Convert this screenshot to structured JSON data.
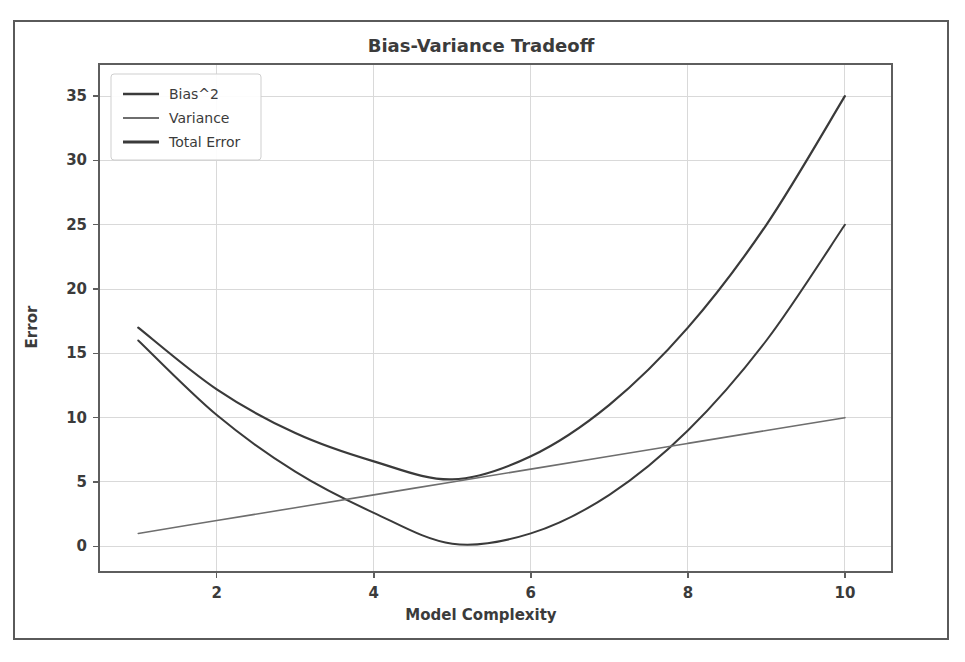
{
  "figure": {
    "title": "Bias-Variance Tradeoff",
    "background": "#ffffff",
    "border_color": "#5a5a5a"
  },
  "chart_data": {
    "type": "line",
    "title": "Bias-Variance Tradeoff",
    "xlabel": "Model Complexity",
    "ylabel": "Error",
    "xlim": [
      0.5,
      10.6
    ],
    "ylim": [
      -2.0,
      37.5
    ],
    "xticks": [
      2,
      4,
      6,
      8,
      10
    ],
    "yticks": [
      0,
      5,
      10,
      15,
      20,
      25,
      30,
      35
    ],
    "grid": true,
    "legend_position": "upper left",
    "x": [
      1,
      2,
      3,
      4,
      5,
      6,
      7,
      8,
      9,
      10
    ],
    "series": [
      {
        "name": "Bias^2",
        "color": "#3a3a3a",
        "width": 2.0,
        "values": [
          16.0,
          10.2,
          5.8,
          2.6,
          0.2,
          1.0,
          4.0,
          9.0,
          16.0,
          25.0
        ]
      },
      {
        "name": "Variance",
        "color": "#6e6e6e",
        "width": 1.6,
        "values": [
          1.0,
          2.0,
          3.0,
          4.0,
          5.0,
          6.0,
          7.0,
          8.0,
          9.0,
          10.0
        ]
      },
      {
        "name": "Total Error",
        "color": "#3a3a3a",
        "width": 2.2,
        "values": [
          17.0,
          12.2,
          8.8,
          6.6,
          5.2,
          7.0,
          11.0,
          17.0,
          25.0,
          35.0
        ]
      }
    ]
  },
  "legend": {
    "items": [
      {
        "label": "Bias^2"
      },
      {
        "label": "Variance"
      },
      {
        "label": "Total Error"
      }
    ]
  }
}
